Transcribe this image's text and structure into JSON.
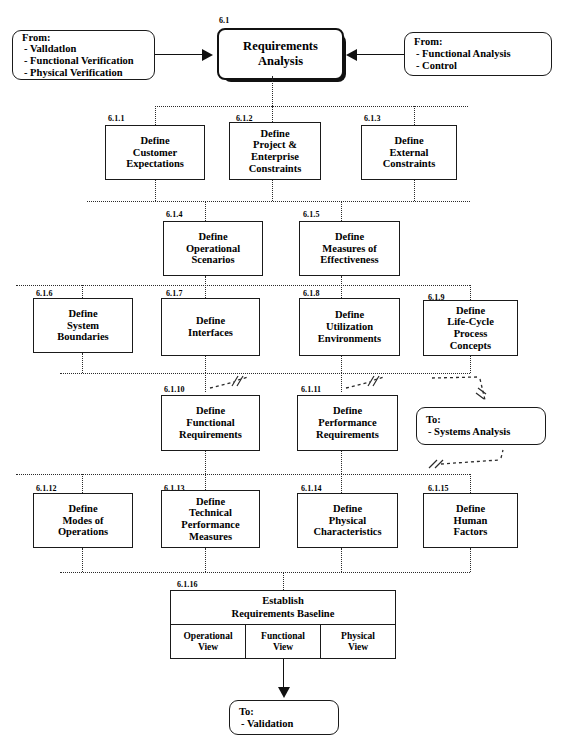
{
  "diagram": {
    "title": "Requirements Analysis",
    "root": {
      "id": "6.1",
      "line1": "Requirements",
      "line2": "Analysis"
    },
    "inputs": [
      {
        "name": "from-left",
        "header": "From:",
        "items": [
          "-  Valldatlon",
          "-  Functional Verification",
          "-  Physical Verification"
        ]
      },
      {
        "name": "from-right",
        "header": "From:",
        "items": [
          "-  Functional Analysis",
          "-  Control"
        ]
      }
    ],
    "outputs": [
      {
        "name": "to-systems-analysis",
        "header": "To:",
        "items": [
          "-  Systems Analysis"
        ]
      },
      {
        "name": "to-validation",
        "header": "To:",
        "items": [
          "-  Validation"
        ]
      }
    ],
    "tasks": [
      {
        "id": "6.1.1",
        "lines": [
          "Define",
          "Customer",
          "Expectations"
        ]
      },
      {
        "id": "6.1.2",
        "lines": [
          "Define",
          "Project &",
          "Enterprise",
          "Constraints"
        ]
      },
      {
        "id": "6.1.3",
        "lines": [
          "Define",
          "External",
          "Constraints"
        ]
      },
      {
        "id": "6.1.4",
        "lines": [
          "Define",
          "Operational",
          "Scenarios"
        ]
      },
      {
        "id": "6.1.5",
        "lines": [
          "Define",
          "Measures of",
          "Effectiveness"
        ]
      },
      {
        "id": "6.1.6",
        "lines": [
          "Define",
          "System",
          "Boundaries"
        ]
      },
      {
        "id": "6.1.7",
        "lines": [
          "Define",
          "Interfaces"
        ]
      },
      {
        "id": "6.1.8",
        "lines": [
          "Define",
          "Utilization",
          "Environments"
        ]
      },
      {
        "id": "6.1.9",
        "lines": [
          "Define",
          "Life-Cycle",
          "Process",
          "Concepts"
        ]
      },
      {
        "id": "6.1.10",
        "lines": [
          "Define",
          "Functional",
          "Requirements"
        ]
      },
      {
        "id": "6.1.11",
        "lines": [
          "Define",
          "Performance",
          "Requirements"
        ]
      },
      {
        "id": "6.1.12",
        "lines": [
          "Define",
          "Modes of",
          "Operations"
        ]
      },
      {
        "id": "6.1.13",
        "lines": [
          "Define",
          "Technical",
          "Performance",
          "Measures"
        ]
      },
      {
        "id": "6.1.14",
        "lines": [
          "Define",
          "Physical",
          "Characteristics"
        ]
      },
      {
        "id": "6.1.15",
        "lines": [
          "Define",
          "Human",
          "Factors"
        ]
      }
    ],
    "baseline": {
      "id": "6.1.16",
      "title_line1": "Establish",
      "title_line2": "Requirements Baseline",
      "views": [
        {
          "line1": "Operational",
          "line2": "View"
        },
        {
          "line1": "Functional",
          "line2": "View"
        },
        {
          "line1": "Physical",
          "line2": "View"
        }
      ]
    },
    "colors": {
      "stroke": "#1a1a1a",
      "dotted": "#2b2b2b",
      "shadow": "#111111",
      "background": "#ffffff"
    }
  }
}
